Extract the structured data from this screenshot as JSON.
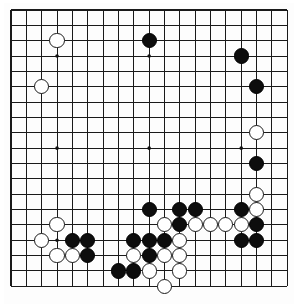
{
  "board": {
    "name": "go-board",
    "size": 19,
    "title": "Go board position",
    "colors": {
      "line": "#1a1a1a",
      "background": "#fdfdfd",
      "black_stone": "#0d0d0d",
      "white_stone": "#ffffff",
      "border": "#1a1a1a"
    },
    "geometry": {
      "origin_x": 11,
      "origin_y": 10,
      "spacing": 15.35,
      "stone_radius": 7.6,
      "star_radius": 1.8
    },
    "star_points": [
      {
        "col": 3,
        "row": 3
      },
      {
        "col": 9,
        "row": 3
      },
      {
        "col": 15,
        "row": 3
      },
      {
        "col": 3,
        "row": 9
      },
      {
        "col": 9,
        "row": 9
      },
      {
        "col": 15,
        "row": 9
      },
      {
        "col": 3,
        "row": 15
      },
      {
        "col": 9,
        "row": 15
      },
      {
        "col": 15,
        "row": 15
      }
    ],
    "stones": [
      {
        "col": 3,
        "row": 2,
        "color": "white"
      },
      {
        "col": 9,
        "row": 2,
        "color": "black"
      },
      {
        "col": 15,
        "row": 3,
        "color": "black"
      },
      {
        "col": 2,
        "row": 5,
        "color": "white"
      },
      {
        "col": 16,
        "row": 5,
        "color": "black"
      },
      {
        "col": 16,
        "row": 8,
        "color": "white"
      },
      {
        "col": 16,
        "row": 10,
        "color": "black"
      },
      {
        "col": 16,
        "row": 12,
        "color": "white"
      },
      {
        "col": 9,
        "row": 13,
        "color": "black"
      },
      {
        "col": 11,
        "row": 13,
        "color": "black"
      },
      {
        "col": 12,
        "row": 13,
        "color": "black"
      },
      {
        "col": 15,
        "row": 13,
        "color": "black"
      },
      {
        "col": 16,
        "row": 13,
        "color": "white"
      },
      {
        "col": 10,
        "row": 14,
        "color": "white"
      },
      {
        "col": 11,
        "row": 14,
        "color": "black"
      },
      {
        "col": 12,
        "row": 14,
        "color": "white"
      },
      {
        "col": 13,
        "row": 14,
        "color": "white"
      },
      {
        "col": 14,
        "row": 14,
        "color": "white"
      },
      {
        "col": 15,
        "row": 14,
        "color": "white"
      },
      {
        "col": 16,
        "row": 14,
        "color": "black"
      },
      {
        "col": 3,
        "row": 14,
        "color": "white"
      },
      {
        "col": 2,
        "row": 15,
        "color": "white"
      },
      {
        "col": 4,
        "row": 15,
        "color": "black"
      },
      {
        "col": 5,
        "row": 15,
        "color": "black"
      },
      {
        "col": 8,
        "row": 15,
        "color": "black"
      },
      {
        "col": 9,
        "row": 15,
        "color": "black"
      },
      {
        "col": 10,
        "row": 15,
        "color": "black"
      },
      {
        "col": 11,
        "row": 15,
        "color": "white"
      },
      {
        "col": 15,
        "row": 15,
        "color": "black"
      },
      {
        "col": 16,
        "row": 15,
        "color": "black"
      },
      {
        "col": 3,
        "row": 16,
        "color": "white"
      },
      {
        "col": 4,
        "row": 16,
        "color": "white"
      },
      {
        "col": 5,
        "row": 16,
        "color": "black"
      },
      {
        "col": 8,
        "row": 16,
        "color": "white"
      },
      {
        "col": 9,
        "row": 16,
        "color": "black"
      },
      {
        "col": 10,
        "row": 16,
        "color": "white"
      },
      {
        "col": 11,
        "row": 16,
        "color": "white"
      },
      {
        "col": 7,
        "row": 17,
        "color": "black"
      },
      {
        "col": 8,
        "row": 17,
        "color": "black"
      },
      {
        "col": 9,
        "row": 17,
        "color": "white"
      },
      {
        "col": 11,
        "row": 17,
        "color": "white"
      },
      {
        "col": 10,
        "row": 18,
        "color": "white"
      }
    ]
  }
}
